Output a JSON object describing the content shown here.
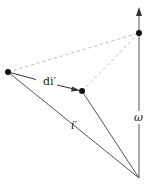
{
  "diagram": {
    "colors": {
      "line": "#555555",
      "dashed": "#bbbbbb",
      "point": "#111111",
      "text": "#222222"
    },
    "points": {
      "left": {
        "x": 8,
        "y": 72
      },
      "middle": {
        "x": 82,
        "y": 91
      },
      "top_right": {
        "x": 139,
        "y": 33
      },
      "origin": {
        "x": 139,
        "y": 178
      }
    },
    "labels": {
      "di_prime": "di′",
      "i_prime": "i′",
      "omega": "ω"
    }
  }
}
